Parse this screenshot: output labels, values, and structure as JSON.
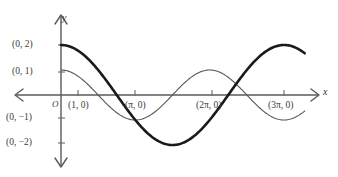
{
  "figure": {
    "background_color": "#ffffff",
    "axis_color": "#5a5a5a",
    "thick_curve_color": "#1a1a1a",
    "thin_curve_color": "#555555"
  },
  "axes": {
    "x_label": "x",
    "y_label": "y",
    "origin_label": "O"
  },
  "y_labels": [
    {
      "text": "(0, 2)",
      "value": 2
    },
    {
      "text": "(0, 1)",
      "value": 1
    },
    {
      "text": "(0, −1)",
      "value": -1
    },
    {
      "text": "(0, −2)",
      "value": -2
    }
  ],
  "x_labels": [
    {
      "text": "(1, 0)",
      "value": 1
    },
    {
      "text": "(π, 0)",
      "value": 3.1416
    },
    {
      "text": "(2π, 0)",
      "value": 6.2832
    },
    {
      "text": "(3π, 0)",
      "value": 9.4248
    }
  ],
  "chart_data": {
    "type": "line",
    "title": "",
    "xlabel": "x",
    "ylabel": "y",
    "grid": false,
    "legend": "none",
    "xlim": [
      -0.8,
      10.6
    ],
    "ylim": [
      -2.6,
      2.6
    ],
    "xticks": [
      1,
      3.1416,
      6.2832,
      9.4248
    ],
    "xticklabels": [
      "(1, 0)",
      "(π, 0)",
      "(2π, 0)",
      "(3π, 0)"
    ],
    "yticks": [
      2,
      1,
      -1,
      -2
    ],
    "yticklabels": [
      "(0, 2)",
      "(0, 1)",
      "(0, −1)",
      "(0, −2)"
    ],
    "series": [
      {
        "name": "thick-cosine",
        "style": "thick",
        "amplitude": 2,
        "period": 9.4248,
        "expression": "y = 2 cos(2x/3)",
        "x": [
          0.0,
          0.4712,
          0.9425,
          1.4137,
          1.885,
          2.3562,
          2.8274,
          3.2987,
          3.7699,
          4.2412,
          4.7124,
          5.1836,
          5.6549,
          6.1261,
          6.5973,
          7.0686,
          7.5398,
          8.0111,
          8.4823,
          8.9535,
          9.4248
        ],
        "y": [
          2.0,
          1.9616,
          1.8478,
          1.6629,
          1.4142,
          1.1111,
          0.7654,
          0.3902,
          0.0,
          -0.3902,
          -0.7654,
          -1.1111,
          -1.4142,
          -1.6629,
          -1.8478,
          -1.9616,
          -2.0,
          -1.9616,
          -1.8478,
          -1.6629,
          -1.4142
        ]
      },
      {
        "name": "thin-cosine",
        "style": "thin",
        "amplitude": 1,
        "period": 6.2832,
        "expression": "y = cos(x)",
        "x": [
          0.0,
          0.4712,
          0.9425,
          1.4137,
          1.885,
          2.3562,
          2.8274,
          3.2987,
          3.7699,
          4.2412,
          4.7124,
          5.1836,
          5.6549,
          6.1261,
          6.5973,
          7.0686,
          7.5398,
          8.0111,
          8.4823,
          8.9535,
          9.4248
        ],
        "y": [
          1.0,
          0.891,
          0.5878,
          0.1564,
          -0.309,
          -0.7071,
          -0.9511,
          -0.9877,
          -0.809,
          -0.454,
          0.0,
          0.454,
          0.809,
          0.9877,
          0.9511,
          0.7071,
          0.309,
          -0.1564,
          -0.5878,
          -0.891,
          -1.0
        ]
      }
    ]
  }
}
